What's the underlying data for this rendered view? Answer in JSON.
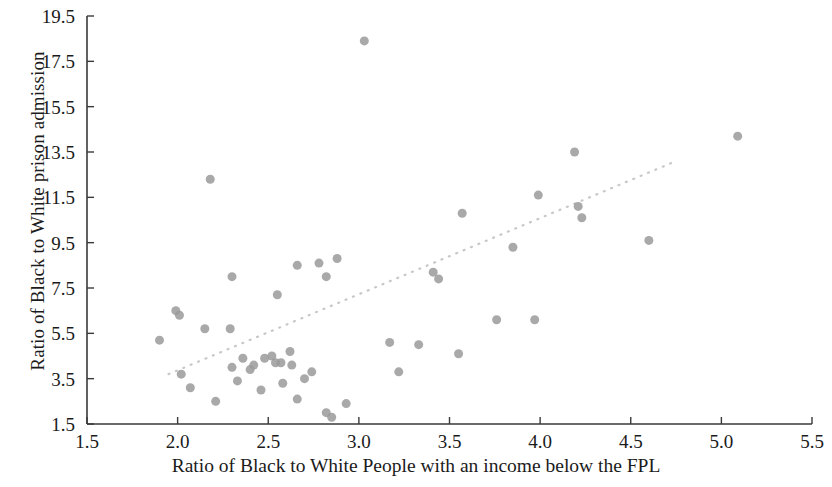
{
  "chart_data": {
    "type": "scatter",
    "title": "",
    "xlabel": "Ratio of Black to White People with an income below the FPL",
    "ylabel": "Ratio of Black to White prison admission",
    "xlim": [
      1.5,
      5.5
    ],
    "ylim": [
      1.5,
      19.5
    ],
    "xticks": [
      "1.5",
      "2.0",
      "2.5",
      "3.0",
      "3.5",
      "4.0",
      "4.5",
      "5.0",
      "5.5"
    ],
    "yticks": [
      "1.5",
      "3.5",
      "5.5",
      "7.5",
      "9.5",
      "11.5",
      "13.5",
      "15.5",
      "17.5",
      "19.5"
    ],
    "grid": false,
    "legend": "none",
    "marker_color": "#9a9a9a",
    "marker_size": 9,
    "axis_color": "#3a3a3a",
    "trendline": {
      "style": "dotted",
      "color": "#c8c8c8",
      "x0": 1.95,
      "y0": 3.7,
      "x1": 4.75,
      "y1": 13.1
    },
    "points": [
      {
        "x": 1.9,
        "y": 5.2
      },
      {
        "x": 1.99,
        "y": 6.5
      },
      {
        "x": 2.01,
        "y": 6.3
      },
      {
        "x": 2.02,
        "y": 3.7
      },
      {
        "x": 2.07,
        "y": 3.1
      },
      {
        "x": 2.15,
        "y": 5.7
      },
      {
        "x": 2.18,
        "y": 12.3
      },
      {
        "x": 2.21,
        "y": 2.5
      },
      {
        "x": 2.3,
        "y": 8.0
      },
      {
        "x": 2.29,
        "y": 5.7
      },
      {
        "x": 2.3,
        "y": 4.0
      },
      {
        "x": 2.33,
        "y": 3.4
      },
      {
        "x": 2.36,
        "y": 4.4
      },
      {
        "x": 2.4,
        "y": 3.9
      },
      {
        "x": 2.42,
        "y": 4.1
      },
      {
        "x": 2.46,
        "y": 3.0
      },
      {
        "x": 2.48,
        "y": 4.4
      },
      {
        "x": 2.52,
        "y": 4.5
      },
      {
        "x": 2.54,
        "y": 4.2
      },
      {
        "x": 2.55,
        "y": 7.2
      },
      {
        "x": 2.57,
        "y": 4.2
      },
      {
        "x": 2.58,
        "y": 3.3
      },
      {
        "x": 2.62,
        "y": 4.7
      },
      {
        "x": 2.63,
        "y": 4.1
      },
      {
        "x": 2.66,
        "y": 8.5
      },
      {
        "x": 2.66,
        "y": 2.6
      },
      {
        "x": 2.7,
        "y": 3.5
      },
      {
        "x": 2.74,
        "y": 3.8
      },
      {
        "x": 2.78,
        "y": 8.6
      },
      {
        "x": 2.82,
        "y": 8.0
      },
      {
        "x": 2.82,
        "y": 2.0
      },
      {
        "x": 2.85,
        "y": 1.8
      },
      {
        "x": 2.88,
        "y": 8.8
      },
      {
        "x": 2.93,
        "y": 2.4
      },
      {
        "x": 3.03,
        "y": 18.4
      },
      {
        "x": 3.17,
        "y": 5.1
      },
      {
        "x": 3.22,
        "y": 3.8
      },
      {
        "x": 3.33,
        "y": 5.0
      },
      {
        "x": 3.41,
        "y": 8.2
      },
      {
        "x": 3.44,
        "y": 7.9
      },
      {
        "x": 3.55,
        "y": 4.6
      },
      {
        "x": 3.57,
        "y": 10.8
      },
      {
        "x": 3.76,
        "y": 6.1
      },
      {
        "x": 3.85,
        "y": 9.3
      },
      {
        "x": 3.97,
        "y": 6.1
      },
      {
        "x": 3.99,
        "y": 11.6
      },
      {
        "x": 4.19,
        "y": 13.5
      },
      {
        "x": 4.21,
        "y": 11.1
      },
      {
        "x": 4.23,
        "y": 10.6
      },
      {
        "x": 4.6,
        "y": 9.6
      },
      {
        "x": 5.09,
        "y": 14.2
      }
    ]
  }
}
